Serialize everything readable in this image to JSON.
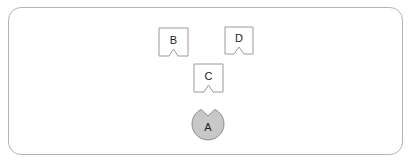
{
  "diagram": {
    "frame": {
      "border_color": "#b4b4b4",
      "background": "#ffffff"
    },
    "nodes": [
      {
        "id": "B",
        "label": "B",
        "shape": "notched-box",
        "x": 159,
        "y": 28,
        "w": 29,
        "h": 28
      },
      {
        "id": "D",
        "label": "D",
        "shape": "notched-box",
        "x": 225,
        "y": 27,
        "w": 28,
        "h": 27
      },
      {
        "id": "C",
        "label": "C",
        "shape": "notched-box",
        "x": 194,
        "y": 64,
        "w": 29,
        "h": 28
      },
      {
        "id": "A",
        "label": "A",
        "shape": "notched-circle",
        "cx": 208,
        "cy": 124,
        "r": 16,
        "fill": "#c8c8c8"
      }
    ],
    "colors": {
      "stroke": "#9a9a9a",
      "box_fill": "#ffffff",
      "circle_fill": "#c8c8c8",
      "circle_stroke": "#8c8c8c"
    }
  }
}
